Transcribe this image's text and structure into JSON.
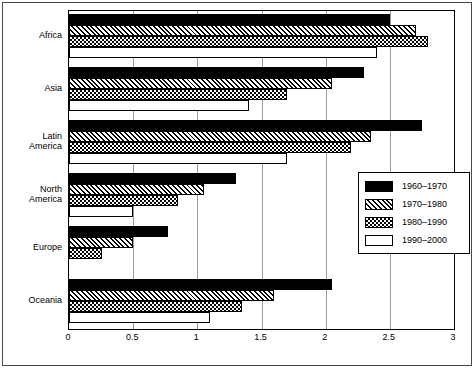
{
  "chart_data": {
    "type": "bar",
    "orientation": "horizontal",
    "title": "",
    "xlabel": "",
    "ylabel": "",
    "xlim": [
      0,
      3
    ],
    "xticks": [
      "0",
      "0.5",
      "1",
      "1.5",
      "2",
      "2.5",
      "3"
    ],
    "xtick_values": [
      0,
      0.5,
      1,
      1.5,
      2,
      2.5,
      3
    ],
    "grid": true,
    "grid_axis": "x",
    "legend_position": "center-right",
    "categories": [
      "Africa",
      "Asia",
      "Latin America",
      "North America",
      "Europe",
      "Oceania"
    ],
    "series": [
      {
        "name": "1960–1970",
        "pattern": "solid-black",
        "values": [
          2.5,
          2.3,
          2.75,
          1.3,
          0.77,
          2.05
        ]
      },
      {
        "name": "1970–1980",
        "pattern": "diagonal-hatch",
        "values": [
          2.7,
          2.05,
          2.35,
          1.05,
          0.5,
          1.6
        ]
      },
      {
        "name": "1980–1990",
        "pattern": "checkerboard",
        "values": [
          2.8,
          1.7,
          2.2,
          0.85,
          0.26,
          1.35
        ]
      },
      {
        "name": "1990–2000",
        "pattern": "empty-white",
        "values": [
          2.4,
          1.4,
          1.7,
          0.5,
          0.0,
          1.1
        ]
      }
    ]
  },
  "colors": {
    "bar_outline": "#000000",
    "solid_fill": "#000000",
    "empty_fill": "#ffffff",
    "gridline": "#9a9a9a",
    "axis": "#000000",
    "frame": "#4a4a4a"
  }
}
